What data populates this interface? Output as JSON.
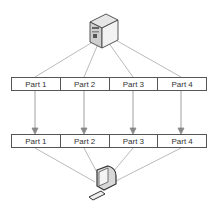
{
  "diagram": {
    "server": {
      "label": "server-icon"
    },
    "client": {
      "label": "computer-icon"
    },
    "top_row": {
      "parts": [
        "Part 1",
        "Part 2",
        "Part 3",
        "Part 4"
      ]
    },
    "bottom_row": {
      "parts": [
        "Part 1",
        "Part 2",
        "Part 3",
        "Part 4"
      ]
    },
    "colors": {
      "line": "#9a9a9a",
      "box_border": "#555555",
      "text": "#333333"
    }
  }
}
